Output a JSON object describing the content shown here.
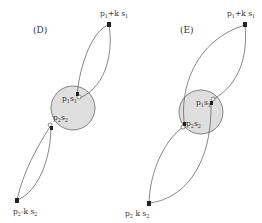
{
  "colors": {
    "circle_fill": "#dedede",
    "circle_stroke": "#666666",
    "line": "#555555",
    "text": "#333333"
  },
  "panels": [
    {
      "id": "D",
      "label": "(D)",
      "top_point": {
        "text": "p",
        "sub1": "1",
        "mid": "+k s",
        "sub2": "1"
      },
      "inner_top": {
        "text": "p",
        "sub1": "1",
        "mid": "s",
        "sub2": "1"
      },
      "inner_bottom": {
        "text": "p",
        "sub1": "2",
        "mid": "s",
        "sub2": "2"
      },
      "bottom_point": {
        "text": "p",
        "sub1": "2",
        "mid": "-k s",
        "sub2": "2"
      }
    },
    {
      "id": "E",
      "label": "(E)",
      "top_point": {
        "text": "p",
        "sub1": "1",
        "mid": "+k s",
        "sub2": "1"
      },
      "inner_top": {
        "text": "p",
        "sub1": "1",
        "mid": "s",
        "sub2": "1"
      },
      "inner_bottom": {
        "text": "p",
        "sub1": "2",
        "mid": "s",
        "sub2": "2"
      },
      "bottom_point": {
        "text": "p",
        "sub1": "2",
        "mid": " k s",
        "sub2": "2"
      }
    }
  ]
}
